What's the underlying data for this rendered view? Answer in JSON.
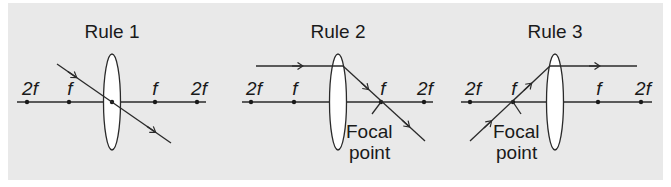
{
  "figure": {
    "background": "#e9e9e9",
    "ink": "#1a1a1a",
    "panels": [
      {
        "title": "Rule 1",
        "labels": {
          "left_2f": "2f",
          "left_f": "f",
          "right_f": "f",
          "right_2f": "2f"
        },
        "description": "Ray through lens center passes undeviated"
      },
      {
        "title": "Rule 2",
        "labels": {
          "left_2f": "2f",
          "left_f": "f",
          "right_f": "f",
          "right_2f": "2f"
        },
        "annotation": [
          "Focal",
          "point"
        ],
        "description": "Ray parallel to axis refracts through far focal point"
      },
      {
        "title": "Rule 3",
        "labels": {
          "left_2f": "2f",
          "left_f": "f",
          "right_f": "f",
          "right_2f": "2f"
        },
        "annotation": [
          "Focal",
          "point"
        ],
        "description": "Ray through near focal point emerges parallel to axis"
      }
    ]
  }
}
